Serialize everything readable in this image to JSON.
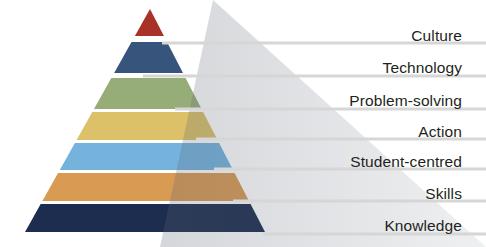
{
  "diagram": {
    "type": "pyramid",
    "title": "",
    "background_color": "#ffffff",
    "label_color": "#231f20",
    "separator_color": "#d6d6d6",
    "shadow_color": "rgba(90,100,115,0.22)",
    "tiers": [
      {
        "rank": 1,
        "position": "apex",
        "label": "Culture",
        "color": "#a93226",
        "label_y": 28,
        "separator_y": 43,
        "separator_x_start": 162
      },
      {
        "rank": 2,
        "label": "Technology",
        "color": "#37557c",
        "label_y": 60,
        "separator_y": 76,
        "separator_x_start": 143
      },
      {
        "rank": 3,
        "label": "Problem-solving",
        "color": "#96ad77",
        "label_y": 93,
        "separator_y": 109,
        "separator_x_start": 175
      },
      {
        "rank": 4,
        "label": "Action",
        "color": "#dcc169",
        "label_y": 124,
        "separator_y": 139,
        "separator_x_start": 196
      },
      {
        "rank": 5,
        "label": "Student-centred",
        "color": "#75b3dd",
        "label_y": 154,
        "separator_y": 169,
        "separator_x_start": 214
      },
      {
        "rank": 6,
        "label": "Skills",
        "color": "#d99a53",
        "label_y": 186,
        "separator_y": 201,
        "separator_x_start": 233
      },
      {
        "rank": 7,
        "position": "base",
        "label": "Knowledge",
        "color": "#1d2d4f",
        "label_y": 218,
        "separator_y": 234,
        "separator_x_start": 263
      }
    ],
    "geometry": {
      "apex_x": 150,
      "apex_y": 9,
      "base_left_x": 25,
      "base_right_x": 265,
      "base_y": 232
    }
  }
}
